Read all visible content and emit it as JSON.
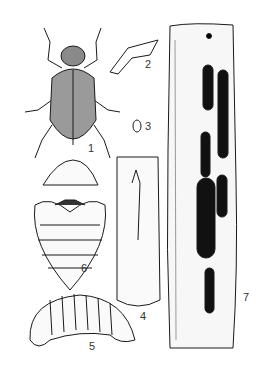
{
  "figure": {
    "type": "entomology-plate",
    "labels": [
      {
        "id": "1",
        "text": "1",
        "subject": "adult beetle (weevil), dorsal view"
      },
      {
        "id": "2",
        "text": "2",
        "subject": "detail / antenna-leg part"
      },
      {
        "id": "3",
        "text": "3",
        "subject": "egg"
      },
      {
        "id": "4",
        "text": "4",
        "subject": "stem section with oviposition scar"
      },
      {
        "id": "5",
        "text": "5",
        "subject": "larva, lateral view"
      },
      {
        "id": "6",
        "text": "6",
        "subject": "pupa, ventral view"
      },
      {
        "id": "7",
        "text": "7",
        "subject": "stem with larval galleries"
      }
    ],
    "colors": {
      "ink": "#1a1a1a",
      "paper": "#ffffff",
      "shade": "#555555"
    }
  }
}
